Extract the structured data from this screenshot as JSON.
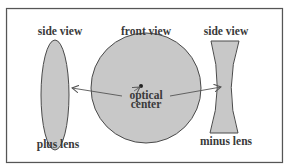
{
  "diagram": {
    "labels": {
      "plus_side_view": "side view",
      "front_view": "front view",
      "minus_side_view": "side view",
      "plus_lens": "plus lens",
      "minus_lens": "minus lens",
      "optical_center_line1": "optical",
      "optical_center_line2": "center"
    },
    "colors": {
      "lens_fill": "#c8c8c8",
      "outline": "#4a4a4a",
      "frame": "#555555",
      "text": "#3a3a3a",
      "background": "#ffffff"
    }
  }
}
